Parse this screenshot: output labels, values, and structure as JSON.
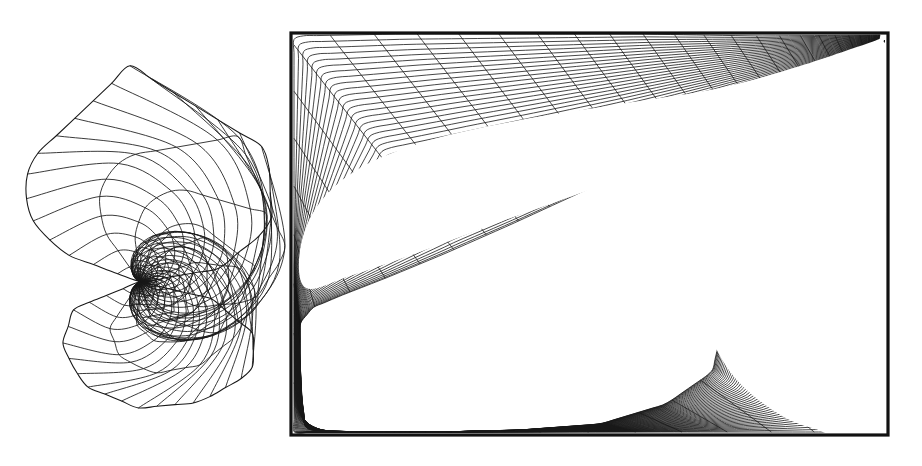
{
  "figure": {
    "kind": "computational-mesh-figure",
    "background_color": "#ffffff",
    "ink_color": "#181818",
    "canvas": {
      "width": 922,
      "height": 466
    },
    "panel_count": 2
  },
  "left_panel": {
    "name": "spiral-surface-mesh",
    "description": "Polygonal surface mesh with a central logarithmic-spiral singularity",
    "bounds": {
      "x": 16,
      "y": 44,
      "width": 268,
      "height": 380
    },
    "singularity": {
      "x": 140,
      "y": 282
    },
    "upper_lobe": {
      "apex": {
        "x": 130,
        "y": 52
      },
      "left_vertex": {
        "x": 28,
        "y": 155
      },
      "right_vertex": {
        "x": 268,
        "y": 142
      },
      "outer_polygon": [
        [
          130,
          52
        ],
        [
          268,
          142
        ],
        [
          272,
          222
        ],
        [
          218,
          268
        ],
        [
          140,
          282
        ],
        [
          60,
          250
        ],
        [
          26,
          208
        ],
        [
          28,
          155
        ]
      ],
      "radial_count": 28,
      "ring_count": 22,
      "spiral_turn_deg": 170
    },
    "lower_lobe": {
      "outer_polygon": [
        [
          140,
          282
        ],
        [
          212,
          300
        ],
        [
          254,
          338
        ],
        [
          252,
          378
        ],
        [
          200,
          410
        ],
        [
          138,
          416
        ],
        [
          84,
          392
        ],
        [
          62,
          350
        ],
        [
          74,
          310
        ]
      ],
      "radial_count": 28,
      "ring_count": 22,
      "spiral_turn_deg": -170
    },
    "stroke_width": 0.85
  },
  "right_panel": {
    "name": "conformal-curvilinear-grid",
    "description": "Body-fitted curvilinear grid inside a rectangular frame with two void lobes and dense clustering toward the upper-right corner",
    "frame": {
      "x": 291,
      "y": 33,
      "width": 597,
      "height": 402
    },
    "frame_stroke_width": 3.2,
    "convergence_point": {
      "x": 884,
      "y": 40
    },
    "void_upper": {
      "label": "upper-blank-lobe",
      "points": [
        [
          300,
          250
        ],
        [
          318,
          205
        ],
        [
          360,
          168
        ],
        [
          430,
          140
        ],
        [
          520,
          120
        ],
        [
          620,
          104
        ],
        [
          720,
          88
        ],
        [
          800,
          66
        ],
        [
          866,
          44
        ],
        [
          884,
          40
        ],
        [
          860,
          74
        ],
        [
          790,
          108
        ],
        [
          700,
          146
        ],
        [
          600,
          186
        ],
        [
          500,
          222
        ],
        [
          420,
          252
        ],
        [
          350,
          276
        ],
        [
          306,
          288
        ]
      ]
    },
    "void_lower": {
      "label": "lower-blank-lobe",
      "points": [
        [
          884,
          42
        ],
        [
          840,
          92
        ],
        [
          786,
          150
        ],
        [
          740,
          208
        ],
        [
          712,
          262
        ],
        [
          706,
          316
        ],
        [
          726,
          366
        ],
        [
          764,
          404
        ],
        [
          812,
          428
        ],
        [
          886,
          434
        ],
        [
          886,
          236
        ],
        [
          886,
          120
        ]
      ]
    },
    "families": {
      "xi_lines": 46,
      "eta_lines": 62,
      "clustering": "geometric toward upper-right singular corner"
    },
    "stroke_width": 0.8
  },
  "icons": {
    "mesh_node": "node-dot-icon",
    "singular_point": "singularity-icon"
  }
}
